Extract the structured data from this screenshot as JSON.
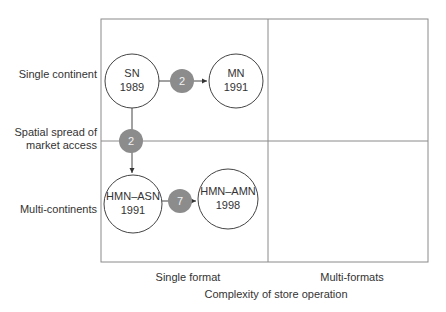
{
  "diagram": {
    "type": "2x2 matrix transition diagram",
    "y_axis": {
      "title_line1": "Spatial spread of",
      "title_line2": "market access",
      "rows": [
        "Single continent",
        "Multi-continents"
      ]
    },
    "x_axis": {
      "title": "Complexity of store operation",
      "columns": [
        "Single format",
        "Multi-formats"
      ]
    },
    "nodes": [
      {
        "id": "sn",
        "line1": "SN",
        "line2": "1989"
      },
      {
        "id": "mn",
        "line1": "MN",
        "line2": "1991"
      },
      {
        "id": "hmn_asn",
        "line1": "HMN–ASN",
        "line2": "1991"
      },
      {
        "id": "hmn_amn",
        "line1": "HMN–AMN",
        "line2": "1998"
      }
    ],
    "transitions": [
      {
        "from": "SN",
        "to": "MN",
        "label": "2"
      },
      {
        "from": "SN",
        "to": "HMN–ASN",
        "label": "2"
      },
      {
        "from": "HMN–ASN",
        "to": "HMN–AMN",
        "label": "7"
      }
    ],
    "colors": {
      "grid": "#8a8a8a",
      "badge": "#8c8c8c",
      "badge_text": "#f2f2f2",
      "line": "#444444"
    }
  }
}
